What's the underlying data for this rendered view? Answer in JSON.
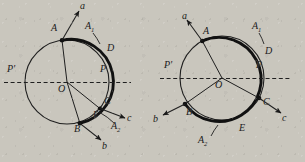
{
  "figure": {
    "type": "geometry-diagram",
    "background_color": "#c9c6bd",
    "ink_color": "#1a1a1a"
  },
  "diagrams": [
    {
      "id": "left",
      "center_label": "O",
      "center": {
        "x": 67,
        "y": 82
      },
      "radius": 42,
      "points": [
        {
          "label": "A",
          "x": 62,
          "y": 35,
          "lx": 51,
          "ly": 28
        },
        {
          "label": "B",
          "x": 80,
          "y": 122,
          "lx": 76,
          "ly": 125
        },
        {
          "label": "C",
          "x": 101,
          "y": 108,
          "lx": 106,
          "ly": 99
        },
        {
          "label": "P",
          "x": 109,
          "y": 82,
          "lx": 101,
          "ly": 66
        },
        {
          "label": "P'",
          "x": 25,
          "y": 82,
          "lx": 8,
          "ly": 66
        }
      ],
      "arc_labels": [
        {
          "label": "A",
          "sub": "1",
          "lx": 90,
          "ly": 27
        },
        {
          "label": "D",
          "sub": "",
          "lx": 110,
          "ly": 49
        },
        {
          "label": "E",
          "sub": "",
          "lx": 97,
          "ly": 114
        },
        {
          "label": "A",
          "sub": "2",
          "lx": 116,
          "ly": 126
        }
      ],
      "rays": [
        {
          "label": "a",
          "lx": 82,
          "ly": 3
        },
        {
          "label": "b",
          "lx": 107,
          "ly": 145
        },
        {
          "label": "c",
          "lx": 130,
          "ly": 120
        }
      ],
      "diameter_label_left": "P'",
      "diameter_label_right": "P"
    },
    {
      "id": "right",
      "center_label": "O",
      "center": {
        "x": 222,
        "y": 78
      },
      "radius": 42,
      "points": [
        {
          "label": "A",
          "x": 203,
          "y": 40,
          "lx": 203,
          "ly": 30
        },
        {
          "label": "B",
          "x": 184,
          "y": 109,
          "lx": 186,
          "ly": 113
        },
        {
          "label": "C",
          "x": 260,
          "y": 106,
          "lx": 265,
          "ly": 100
        },
        {
          "label": "P",
          "x": 264,
          "y": 78,
          "lx": 256,
          "ly": 62
        },
        {
          "label": "P'",
          "x": 180,
          "y": 78,
          "lx": 165,
          "ly": 62
        }
      ],
      "arc_labels": [
        {
          "label": "A",
          "sub": "1",
          "lx": 256,
          "ly": 26
        },
        {
          "label": "D",
          "sub": "",
          "lx": 268,
          "ly": 52
        },
        {
          "label": "E",
          "sub": "",
          "lx": 242,
          "ly": 129
        },
        {
          "label": "A",
          "sub": "2",
          "lx": 203,
          "ly": 139
        }
      ],
      "rays": [
        {
          "label": "a",
          "lx": 184,
          "ly": 14
        },
        {
          "label": "b",
          "lx": 156,
          "ly": 118
        },
        {
          "label": "c",
          "lx": 284,
          "ly": 119
        }
      ],
      "diameter_label_left": "P'",
      "diameter_label_right": "P"
    }
  ]
}
